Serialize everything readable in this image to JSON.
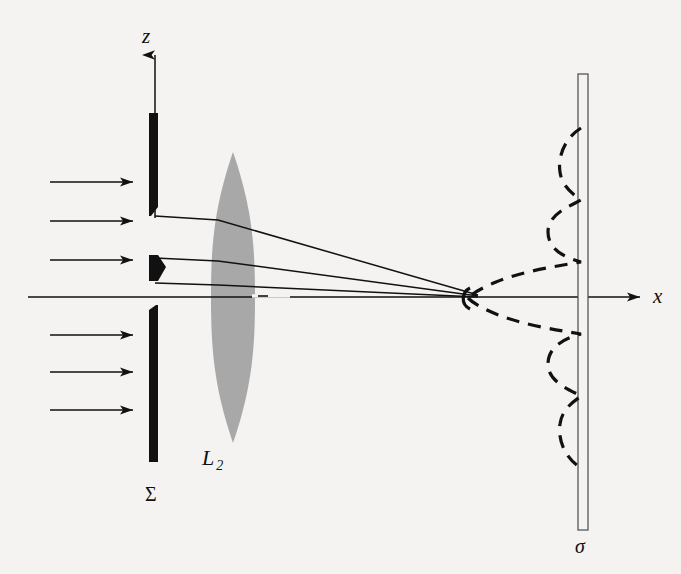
{
  "figure": {
    "kind": "optics-diffraction-diagram",
    "background_color": "#f4f3f1",
    "ink_color": "#111111",
    "lens_fill_color": "#a8a8a8",
    "width": 681,
    "height": 574
  },
  "labels": {
    "z_axis": "z",
    "x_axis": "x",
    "lens": "L",
    "lens_subscript": "2",
    "aperture_screen": "Σ",
    "observation_screen": "σ"
  },
  "axes": {
    "optical_axis": {
      "x1": 28,
      "y1": 297,
      "x2": 648,
      "y2": 297,
      "arrow": "right"
    },
    "vertical_axis": {
      "x1": 155,
      "y1": 218,
      "x2": 155,
      "y2": 48,
      "arrow": "up"
    }
  },
  "incoming_rays": {
    "count": 6,
    "x_start": 50,
    "x_end": 133,
    "arrow": "right",
    "y_positions": [
      182,
      221,
      260,
      335,
      372,
      410
    ]
  },
  "aperture_screen_sigma": {
    "x_center": 153,
    "bar_width": 9,
    "upper_bar": {
      "y_top": 113,
      "y_bottom": 216
    },
    "lower_bar": {
      "y_top": 305,
      "y_bottom": 462
    },
    "wedge_obstacle": {
      "y_top": 255,
      "y_bottom": 281,
      "x_left": 149,
      "x_tip": 166
    },
    "slits": [
      {
        "name": "upper-slit",
        "y_top": 216,
        "y_bottom": 255
      },
      {
        "name": "lower-slit",
        "y_top": 281,
        "y_bottom": 305
      }
    ]
  },
  "lens_L2": {
    "x_center": 233,
    "half_width": 22,
    "y_top": 152,
    "y_bottom": 443
  },
  "converging_rays": [
    {
      "name": "ray-from-upper-slit-top",
      "x1": 155,
      "y1": 216,
      "x2": 478,
      "y2": 295
    },
    {
      "name": "ray-from-upper-slit-bottom",
      "x1": 155,
      "y1": 258,
      "x2": 478,
      "y2": 296
    },
    {
      "name": "ray-on-axis",
      "x1": 155,
      "y1": 283,
      "x2": 478,
      "y2": 297
    }
  ],
  "observation_screen_sigma": {
    "x_left": 578,
    "x_right": 588,
    "y_top": 74,
    "y_bottom": 530,
    "style": "hollow-outline"
  },
  "intensity_profile": {
    "description": "dashed diffraction intensity curve plotted sideways against the observation screen",
    "baseline_x": 581,
    "center_y": 298,
    "main_lobe_peak_x": 468,
    "main_lobe_half_width_y": 34,
    "side_lobes": [
      {
        "side": "upper",
        "peak_x": 548,
        "center_y": 232,
        "half_width_y": 34
      },
      {
        "side": "upper",
        "peak_x": 560,
        "center_y": 172,
        "half_width_y": 26
      },
      {
        "side": "lower",
        "peak_x": 548,
        "center_y": 364,
        "half_width_y": 34
      },
      {
        "side": "lower",
        "peak_x": 560,
        "center_y": 424,
        "half_width_y": 26
      }
    ]
  }
}
